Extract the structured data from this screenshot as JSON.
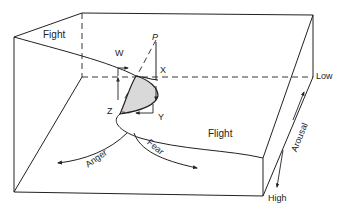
{
  "diagram": {
    "type": "cusp catastrophe surface in a 3D box",
    "labels": {
      "fight": "Fight",
      "flight": "Flight",
      "anger": "Anger",
      "fear": "Fear",
      "arousal": "Arousal",
      "low": "Low",
      "high": "High",
      "w": "W",
      "x": "X",
      "y": "Y",
      "z": "Z",
      "p": "P"
    },
    "colors": {
      "line": "#222222",
      "fold_fill": "#d9d9d9",
      "background": "#ffffff"
    }
  }
}
